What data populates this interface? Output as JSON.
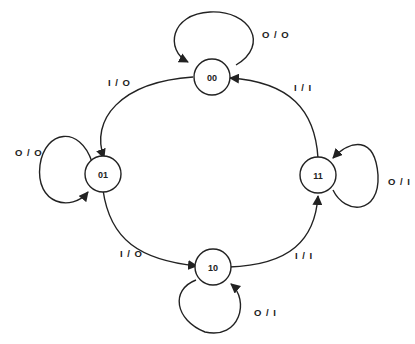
{
  "diagram": {
    "type": "state-transition",
    "states": [
      {
        "id": "00",
        "label": "00"
      },
      {
        "id": "01",
        "label": "01"
      },
      {
        "id": "10",
        "label": "10"
      },
      {
        "id": "11",
        "label": "11"
      }
    ],
    "transitions": [
      {
        "from": "00",
        "to": "00",
        "label": "O/O"
      },
      {
        "from": "00",
        "to": "01",
        "label": "I/O"
      },
      {
        "from": "01",
        "to": "01",
        "label": "O/O"
      },
      {
        "from": "01",
        "to": "10",
        "label": "I/O"
      },
      {
        "from": "10",
        "to": "10",
        "label": "O/I"
      },
      {
        "from": "10",
        "to": "11",
        "label": "I/I"
      },
      {
        "from": "11",
        "to": "11",
        "label": "O/I"
      },
      {
        "from": "11",
        "to": "00",
        "label": "I/I"
      }
    ]
  },
  "labels": {
    "s00": "00",
    "s01": "01",
    "s10": "10",
    "s11": "11",
    "t00_self": "O / O",
    "t00_01": "I / O",
    "t01_self": "O / O",
    "t01_10": "I / O",
    "t10_self": "O / I",
    "t10_11": "I / I",
    "t11_self": "O / I",
    "t11_00": "I / I"
  }
}
